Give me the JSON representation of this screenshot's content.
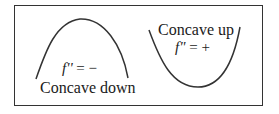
{
  "diagram": {
    "left_panel": {
      "label": "Concave down",
      "equation_fn": "f''",
      "equation_rest": " = −",
      "curve": "concave-down-arc"
    },
    "right_panel": {
      "label": "Concave up",
      "equation_fn": "f\"",
      "equation_rest": " = +",
      "curve": "concave-up-arc"
    },
    "colors": {
      "line": "#333333",
      "text": "#1a1a1a",
      "background": "#ffffff"
    }
  }
}
